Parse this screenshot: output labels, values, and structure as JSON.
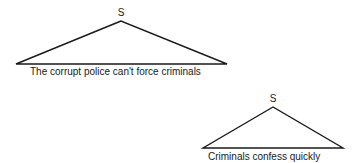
{
  "trees": [
    {
      "node_label": "S",
      "yield_text": "The corrupt police can't force criminals",
      "apex": [
        121,
        21
      ],
      "left": [
        16,
        64
      ],
      "right": [
        227,
        64
      ]
    },
    {
      "node_label": "S",
      "yield_text": "Criminals confess quickly",
      "apex": [
        273,
        107
      ],
      "left": [
        203,
        148
      ],
      "right": [
        343,
        148
      ]
    }
  ],
  "colors": {
    "stroke": "#1a1a1a",
    "background": "#ffffff"
  }
}
